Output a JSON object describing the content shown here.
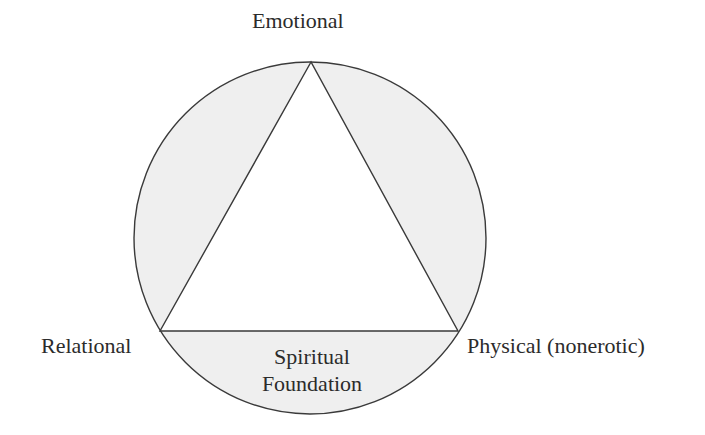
{
  "diagram": {
    "type": "circle-with-inscribed-triangle",
    "colors": {
      "segment_fill": "#efefef",
      "triangle_fill": "#ffffff",
      "stroke": "#3a3a3a",
      "text": "#2b2b2b"
    },
    "vertices": {
      "top": "Emotional",
      "left": "Relational",
      "right": "Physical (nonerotic)"
    },
    "base_segment": {
      "line1": "Spiritual",
      "line2": "Foundation"
    }
  }
}
